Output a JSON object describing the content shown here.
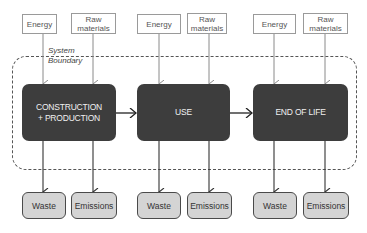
{
  "diagram": {
    "type": "life-cycle-flow",
    "boundary": {
      "label_line1": "System",
      "label_line2": "Boundary"
    },
    "stages": [
      {
        "label_line1": "CONSTRUCTION",
        "label_line2": "+ PRODUCTION",
        "inputs": [
          {
            "label_line1": "Energy",
            "label_line2": ""
          },
          {
            "label_line1": "Raw",
            "label_line2": "materials"
          }
        ],
        "outputs": [
          "Waste",
          "Emissions"
        ]
      },
      {
        "label_line1": "USE",
        "label_line2": "",
        "inputs": [
          {
            "label_line1": "Energy",
            "label_line2": ""
          },
          {
            "label_line1": "Raw",
            "label_line2": "materials"
          }
        ],
        "outputs": [
          "Waste",
          "Emissions"
        ]
      },
      {
        "label_line1": "END OF LIFE",
        "label_line2": "",
        "inputs": [
          {
            "label_line1": "Energy",
            "label_line2": ""
          },
          {
            "label_line1": "Raw",
            "label_line2": "materials"
          }
        ],
        "outputs": [
          "Waste",
          "Emissions"
        ]
      }
    ],
    "colors": {
      "stage_fill": "#3d3d3d",
      "stage_text": "#f0f0f0",
      "output_fill": "#d4d4d4",
      "input_border": "#9a9a9a",
      "arrow": "#333333"
    }
  }
}
